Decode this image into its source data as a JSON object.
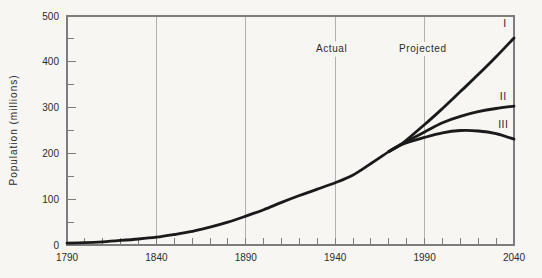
{
  "page": {
    "background": "#f7f6f2",
    "curve_color": "#1a1a1a",
    "axis_color": "#7d7d7d",
    "grid_color": "#b3b1ad",
    "text_color": "#2b2b2b"
  },
  "chart_data": {
    "type": "line",
    "title": "",
    "xlabel": "",
    "ylabel": "Population (millions)",
    "xlim": [
      1790,
      2040
    ],
    "ylim": [
      0,
      500
    ],
    "x_tick_labels": [
      "1790",
      "1840",
      "1890",
      "1940",
      "1990",
      "2040"
    ],
    "x_tick_values": [
      1790,
      1840,
      1890,
      1940,
      1990,
      2040
    ],
    "x_minor_tick_step": 10,
    "y_tick_labels": [
      "0",
      "100",
      "200",
      "300",
      "400",
      "500"
    ],
    "y_tick_values": [
      0,
      100,
      200,
      300,
      400,
      500
    ],
    "y_minor_tick_step": 50,
    "gridlines_x": [
      1840,
      1890,
      1940,
      1990
    ],
    "grid": "vertical-only",
    "legend_position": "none",
    "annotations": [
      {
        "id": "actual",
        "label": "Actual",
        "x": 1938,
        "y": 430
      },
      {
        "id": "projected",
        "label": "Projected",
        "x": 1989,
        "y": 430
      }
    ],
    "series": [
      {
        "id": "actual",
        "name": "Actual",
        "label": "",
        "points": [
          [
            1790,
            4
          ],
          [
            1800,
            5
          ],
          [
            1810,
            7
          ],
          [
            1820,
            10
          ],
          [
            1830,
            13
          ],
          [
            1840,
            17
          ],
          [
            1850,
            23
          ],
          [
            1860,
            30
          ],
          [
            1870,
            39
          ],
          [
            1880,
            50
          ],
          [
            1890,
            63
          ],
          [
            1900,
            77
          ],
          [
            1910,
            93
          ],
          [
            1920,
            108
          ],
          [
            1930,
            122
          ],
          [
            1940,
            136
          ],
          [
            1950,
            153
          ],
          [
            1960,
            178
          ],
          [
            1970,
            204
          ],
          [
            1977,
            220
          ]
        ]
      },
      {
        "id": "series-i",
        "name": "Projection Series I",
        "label": "I",
        "label_x": 2035,
        "label_y": 483,
        "points": [
          [
            1970,
            204
          ],
          [
            1977,
            220
          ],
          [
            1990,
            263
          ],
          [
            2000,
            298
          ],
          [
            2010,
            335
          ],
          [
            2020,
            372
          ],
          [
            2030,
            411
          ],
          [
            2040,
            452
          ]
        ]
      },
      {
        "id": "series-ii",
        "name": "Projection Series II",
        "label": "II",
        "label_x": 2034,
        "label_y": 325,
        "points": [
          [
            1970,
            204
          ],
          [
            1977,
            220
          ],
          [
            1990,
            247
          ],
          [
            2000,
            267
          ],
          [
            2010,
            281
          ],
          [
            2020,
            291
          ],
          [
            2030,
            298
          ],
          [
            2040,
            303
          ]
        ]
      },
      {
        "id": "series-iii",
        "name": "Projection Series III",
        "label": "III",
        "label_x": 2034,
        "label_y": 264,
        "points": [
          [
            1970,
            204
          ],
          [
            1977,
            219
          ],
          [
            1990,
            235
          ],
          [
            2000,
            245
          ],
          [
            2010,
            250
          ],
          [
            2020,
            249
          ],
          [
            2030,
            243
          ],
          [
            2040,
            231
          ]
        ]
      }
    ]
  }
}
